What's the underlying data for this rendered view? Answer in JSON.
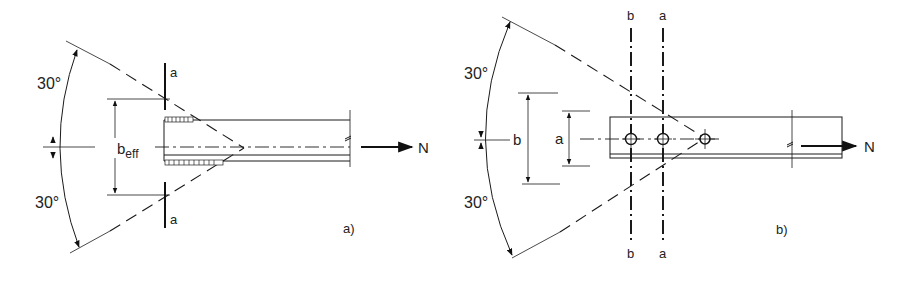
{
  "figure": {
    "panel_a": {
      "caption": "a)",
      "angle_top": "30°",
      "angle_bottom": "30°",
      "width_label_main": "b",
      "width_label_sub": "eff",
      "section_top_label": "a",
      "section_bottom_label": "a",
      "force_label": "N",
      "connection_type": "welded"
    },
    "panel_b": {
      "caption": "b)",
      "angle_top": "30°",
      "angle_bottom": "30°",
      "dim_b_label": "b",
      "dim_a_label": "a",
      "section_b_top_label": "b",
      "section_a_top_label": "a",
      "section_b_bottom_label": "b",
      "section_a_bottom_label": "a",
      "force_label": "N",
      "connection_type": "bolted",
      "bolt_count": 3
    }
  }
}
